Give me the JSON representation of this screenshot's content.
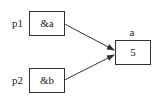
{
  "diagram": {
    "type": "pointer-diagram",
    "nodes": [
      {
        "id": "p1",
        "label": "p1",
        "value": "&a"
      },
      {
        "id": "p2",
        "label": "p2",
        "value": "&b"
      },
      {
        "id": "a",
        "label": "a",
        "value": "5"
      }
    ],
    "edges": [
      {
        "from": "p1",
        "to": "a"
      },
      {
        "from": "p2",
        "to": "a"
      }
    ]
  }
}
